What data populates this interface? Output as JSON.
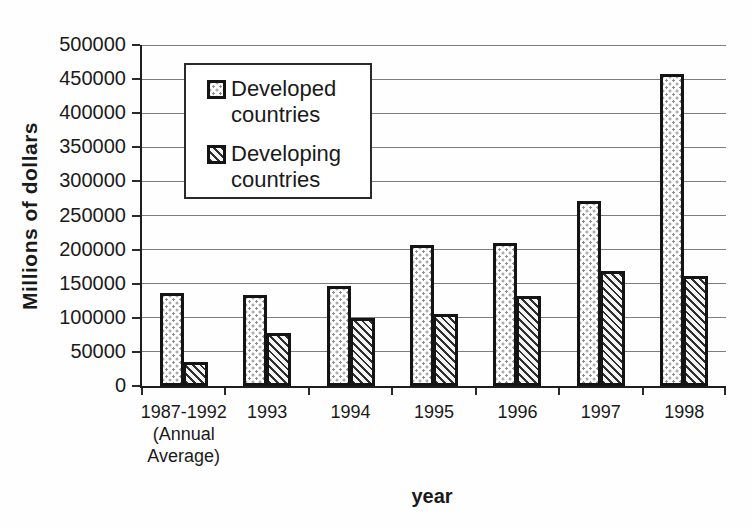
{
  "chart_data": {
    "type": "bar",
    "title": "",
    "xlabel": "year",
    "ylabel": "Millions of dollars",
    "categories": [
      "1987-1992\n(Annual\nAverage)",
      "1993",
      "1994",
      "1995",
      "1996",
      "1997",
      "1998"
    ],
    "series": [
      {
        "name": "Developed countries",
        "pattern": "dotted",
        "values": [
          136000,
          133000,
          146000,
          207000,
          209000,
          271000,
          457000
        ]
      },
      {
        "name": "Developing countries",
        "pattern": "diagonal-hatch",
        "values": [
          35000,
          78000,
          100000,
          105000,
          132000,
          169000,
          161000
        ]
      }
    ],
    "ylim": [
      0,
      500000
    ],
    "y_tick_step": 50000,
    "y_ticks": [
      "0",
      "50000",
      "100000",
      "150000",
      "200000",
      "250000",
      "300000",
      "350000",
      "400000",
      "450000",
      "500000"
    ],
    "grid": "horizontal-gridlines-on",
    "legend_position": "inside-top-left"
  },
  "colors": {
    "ink": "#1a1a1a",
    "gridline": "#7d7d7d",
    "background": "#fefefe",
    "bar_fill_base": "#ffffff"
  }
}
